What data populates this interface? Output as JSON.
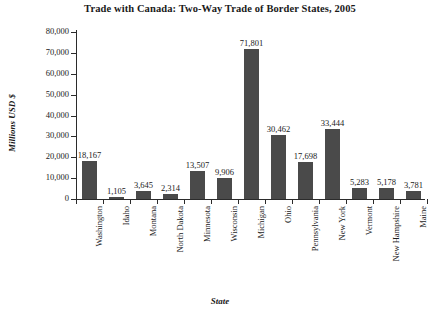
{
  "chart_data": {
    "type": "bar",
    "title": "Trade with Canada: Two-Way Trade of Border States, 2005",
    "xlabel": "State",
    "ylabel": "Millions USD $",
    "ylim": [
      0,
      80000
    ],
    "ytick_step": 10000,
    "ytick_labels": [
      "80,000",
      "70,000",
      "60,000",
      "50,000",
      "40,000",
      "30,000",
      "20,000",
      "10,000",
      "0"
    ],
    "ytick_values": [
      80000,
      70000,
      60000,
      50000,
      40000,
      30000,
      20000,
      10000,
      0
    ],
    "grid": false,
    "legend": false,
    "bar_color": "#4a4a4a",
    "axis_color": "#2b2b2b",
    "categories": [
      "Washington",
      "Idaho",
      "Montana",
      "North Dakota",
      "Minnesota",
      "Wisconsin",
      "Michigan",
      "Ohio",
      "Pennsylvania",
      "New York",
      "Vermont",
      "New Hampshire",
      "Maine"
    ],
    "values": [
      18167,
      1105,
      3645,
      2314,
      13507,
      9906,
      71801,
      30462,
      17698,
      33444,
      5283,
      5178,
      3781
    ],
    "value_labels": [
      "18,167",
      "1,105",
      "3,645",
      "2,314",
      "13,507",
      "9,906",
      "71,801",
      "30,462",
      "17,698",
      "33,444",
      "5,283",
      "5,178",
      "3,781"
    ]
  }
}
